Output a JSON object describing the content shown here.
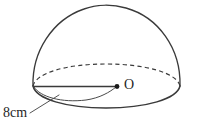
{
  "figure": {
    "name": "hemisphere-diagram",
    "background_color": "#ffffff",
    "stroke_color": "#3a3a3a",
    "text_color": "#262626",
    "labels": {
      "center_point": "O",
      "radius_measure": "8cm"
    },
    "geometry": {
      "apex": {
        "x": 105,
        "y": 5
      },
      "left_rim": {
        "x": 33,
        "y": 86
      },
      "right_rim": {
        "x": 180,
        "y": 86
      },
      "center": {
        "x": 117,
        "y": 86
      },
      "base_front_lowest_y": 107,
      "radius_pixels": 84,
      "radius_value": 8,
      "radius_unit": "cm"
    },
    "elements": [
      {
        "name": "dome-outline",
        "style": "solid"
      },
      {
        "name": "base-ellipse-back",
        "style": "dashed"
      },
      {
        "name": "base-ellipse-front",
        "style": "solid"
      },
      {
        "name": "radius-line",
        "style": "solid"
      },
      {
        "name": "radius-arc",
        "style": "thin-solid"
      },
      {
        "name": "center-dot",
        "style": "filled"
      },
      {
        "name": "measure-leader-line",
        "style": "thin-solid"
      }
    ]
  }
}
